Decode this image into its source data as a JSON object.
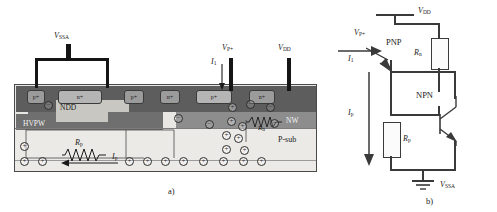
{
  "figure": {
    "caption_a": "a)",
    "caption_b": "b)"
  },
  "cross_section": {
    "terminals": [
      {
        "name": "vssa",
        "label": "V",
        "sub": "SSA"
      },
      {
        "name": "vp_plus",
        "label": "V",
        "sub": "P+"
      },
      {
        "name": "vdd",
        "label": "V",
        "sub": "DD"
      }
    ],
    "currents": [
      {
        "name": "i1",
        "label": "I",
        "sub": "1"
      },
      {
        "name": "ip",
        "label": "I",
        "sub": "p"
      }
    ],
    "resistors": [
      {
        "name": "rp",
        "label": "R",
        "sub": "p"
      },
      {
        "name": "rn",
        "label": "R",
        "sub": "n"
      }
    ],
    "regions": [
      {
        "name": "hvpw",
        "label": "HVPW"
      },
      {
        "name": "ndd",
        "label": "NDD"
      },
      {
        "name": "nw",
        "label": "NW"
      },
      {
        "name": "psub",
        "label": "P-sub"
      }
    ],
    "diffusions": [
      {
        "name": "p-plus-1",
        "label": "p+"
      },
      {
        "name": "n-plus-1",
        "label": "n+"
      },
      {
        "name": "p-plus-2",
        "label": "p+"
      },
      {
        "name": "n-plus-2",
        "label": "n+"
      },
      {
        "name": "p-plus-3",
        "label": "p+"
      },
      {
        "name": "n-plus-3",
        "label": "n+"
      }
    ],
    "carriers": {
      "hole_glyph": "+",
      "electron_glyph": "−"
    }
  },
  "circuit": {
    "supply": {
      "label": "V",
      "sub": "DD"
    },
    "ground": {
      "label": "V",
      "sub": "SSA"
    },
    "input": {
      "label": "V",
      "sub": "P+"
    },
    "transistors": [
      {
        "name": "pnp",
        "label": "PNP"
      },
      {
        "name": "npn",
        "label": "NPN"
      }
    ],
    "resistors": [
      {
        "name": "rn",
        "label": "R",
        "sub": "n"
      },
      {
        "name": "rp",
        "label": "R",
        "sub": "p"
      }
    ],
    "currents": [
      {
        "name": "i1",
        "label": "I",
        "sub": "1"
      },
      {
        "name": "ip",
        "label": "I",
        "sub": "p"
      }
    ]
  }
}
